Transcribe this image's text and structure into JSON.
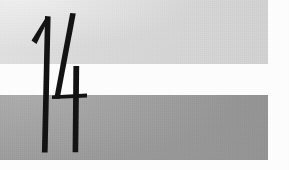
{
  "page": {
    "width": 289,
    "height": 170,
    "background_color": "#ffffff"
  },
  "bands": [
    {
      "name": "upper-light-band",
      "tone": "light gray",
      "color": "#d8d8d8",
      "x": 0,
      "y": 0,
      "width": 268,
      "height": 64
    },
    {
      "name": "lower-dark-band",
      "tone": "medium gray",
      "color": "#9a9a9a",
      "x": 0,
      "y": 95,
      "width": 268,
      "height": 65
    }
  ],
  "gap": {
    "name": "white-gap",
    "color": "#ffffff",
    "y": 64,
    "height": 31
  },
  "numeral": {
    "text": "14",
    "label": "page-number-14",
    "color": "#111111",
    "style": "hand-drawn narrow brush strokes",
    "digits": [
      {
        "value": "1",
        "strokes": [
          "upward diagonal flag",
          "tall near-vertical stem"
        ]
      },
      {
        "value": "4",
        "strokes": [
          "steep diagonal",
          "vertical stem",
          "horizontal crossbar"
        ]
      }
    ]
  }
}
